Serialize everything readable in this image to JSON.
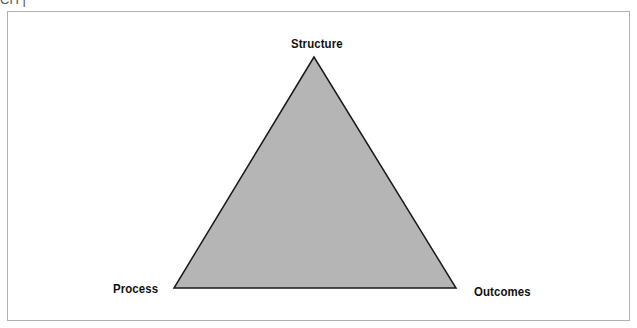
{
  "header": {
    "cut_text": "CH    |"
  },
  "diagram": {
    "title": "",
    "shape": "triangle",
    "fill_color": "#b5b5b5",
    "stroke_color": "#1a1a1a",
    "vertices": {
      "top": {
        "label": "Structure",
        "x": 314,
        "y": 57
      },
      "bottom_left": {
        "label": "Process",
        "x": 174,
        "y": 288
      },
      "bottom_right": {
        "label": "Outcomes",
        "x": 456,
        "y": 288
      }
    }
  }
}
